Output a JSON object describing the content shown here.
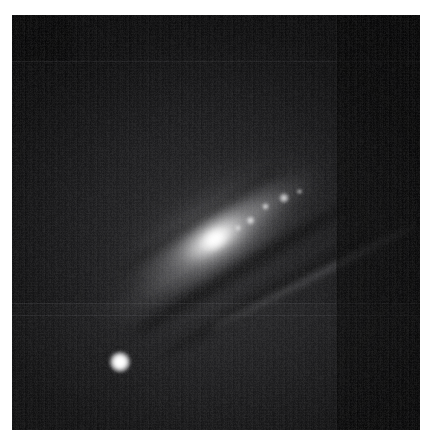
{
  "page": {
    "background_color": "#ffffff",
    "width": 432,
    "height": 447
  },
  "caption_remnant": {
    "text": "",
    "note": "cropped text descenders visible at very top edge"
  },
  "image_panel": {
    "name": "astronomical-image",
    "left": 12,
    "top": 15,
    "width": 408,
    "height": 415,
    "background_color": "#050505",
    "colormap": "grayscale",
    "alt": "Grayscale astronomical image of an inclined spiral galaxy with bright elongated nucleus, dust lanes, and a compact bright companion at lower left"
  },
  "features": {
    "galaxy": {
      "label": "spiral-galaxy",
      "center_x": 203,
      "center_y": 223,
      "position_angle_deg": -33,
      "bulge_width": 104,
      "bulge_height": 45,
      "halo_width": 330,
      "halo_height": 150,
      "peak_brightness": "#ffffff"
    },
    "companion": {
      "label": "bright-companion-source",
      "center_x": 108,
      "center_y": 347,
      "radius": 11,
      "color": "#ffffff"
    },
    "knots": [
      {
        "label": "hii-knot-1",
        "x": 238,
        "y": 205,
        "size": 9
      },
      {
        "label": "hii-knot-2",
        "x": 253,
        "y": 191,
        "size": 7
      },
      {
        "label": "hii-knot-3",
        "x": 272,
        "y": 183,
        "size": 10
      },
      {
        "label": "hii-knot-4",
        "x": 226,
        "y": 213,
        "size": 6
      },
      {
        "label": "hii-knot-5",
        "x": 287,
        "y": 176,
        "size": 5
      }
    ],
    "seams": {
      "vertical_x": [
        324
      ],
      "horizontal_y": [
        46,
        288,
        300
      ]
    },
    "noise": {
      "vertical_striping": true,
      "horizontal_striping": true
    }
  }
}
